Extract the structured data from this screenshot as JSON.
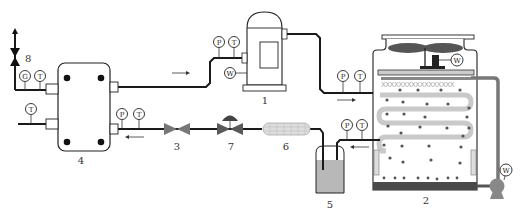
{
  "diagram": {
    "colors": {
      "pipe": "#1a1a1a",
      "water_pipe": "#777777",
      "valve": "#6e6e6e",
      "tank_fill": "#b8b8b8",
      "basin": "#4a4a4a",
      "coil": "#c9c9c9"
    },
    "components": [
      {
        "id": "1",
        "label": "1",
        "name": "Compressor"
      },
      {
        "id": "2",
        "label": "2",
        "name": "Evaporative cooling tower / condenser"
      },
      {
        "id": "3",
        "label": "3",
        "name": "Valve"
      },
      {
        "id": "4",
        "label": "4",
        "name": "Plate heat exchanger"
      },
      {
        "id": "5",
        "label": "5",
        "name": "Liquid receiver"
      },
      {
        "id": "6",
        "label": "6",
        "name": "Filter drier"
      },
      {
        "id": "7",
        "label": "7",
        "name": "Solenoid / expansion valve"
      },
      {
        "id": "8",
        "label": "8",
        "name": "Stop valve"
      }
    ],
    "gauges": {
      "P": "P",
      "T": "T",
      "G": "G",
      "W": "W"
    }
  }
}
